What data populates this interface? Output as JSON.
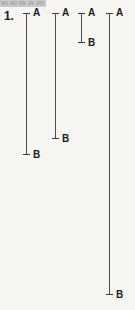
{
  "page": {
    "background_color": "#f6f5f1",
    "line_color": "#4a4a4a",
    "text_color": "#1d1d1d",
    "width": 135,
    "height": 310
  },
  "header": {
    "strip_color": "#c9c9c9"
  },
  "item": {
    "number_label": "1."
  },
  "chart_data": {
    "type": "bar",
    "title": "",
    "xlabel": "",
    "ylabel": "",
    "orientation": "vertical",
    "grid": false,
    "legend": null,
    "categories": [
      "1",
      "2",
      "3",
      "4"
    ],
    "series": [
      {
        "name": "A",
        "values": [
          13,
          13,
          13,
          13
        ]
      },
      {
        "name": "B",
        "values": [
          155,
          139,
          43,
          295
        ]
      }
    ],
    "ylim": [
      0,
      310
    ],
    "annotations": [
      "1."
    ]
  },
  "brackets": [
    {
      "id": "bracket-1",
      "top_label": "A",
      "bottom_label": "B",
      "left": 23,
      "top": 13,
      "height": 142
    },
    {
      "id": "bracket-2",
      "top_label": "A",
      "bottom_label": "B",
      "left": 52,
      "top": 13,
      "height": 126
    },
    {
      "id": "bracket-3",
      "top_label": "A",
      "bottom_label": "B",
      "left": 78,
      "top": 13,
      "height": 30
    },
    {
      "id": "bracket-4",
      "top_label": "A",
      "bottom_label": "B",
      "left": 106,
      "top": 13,
      "height": 282
    }
  ]
}
